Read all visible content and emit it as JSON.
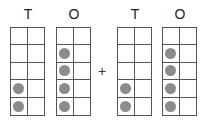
{
  "operator": "+",
  "frames": [
    {
      "label": "T",
      "left": 10,
      "dots": [
        [
          3,
          0
        ],
        [
          4,
          0
        ]
      ]
    },
    {
      "label": "O",
      "left": 56,
      "dots": [
        [
          1,
          0
        ],
        [
          2,
          0
        ],
        [
          3,
          0
        ],
        [
          4,
          0
        ]
      ]
    },
    {
      "label": "T",
      "left": 117,
      "dots": [
        [
          3,
          0
        ],
        [
          4,
          0
        ]
      ]
    },
    {
      "label": "O",
      "left": 162,
      "dots": [
        [
          1,
          0
        ],
        [
          2,
          0
        ],
        [
          3,
          0
        ],
        [
          4,
          0
        ]
      ]
    }
  ],
  "values": {
    "first_addend": 24,
    "second_addend": 24
  }
}
